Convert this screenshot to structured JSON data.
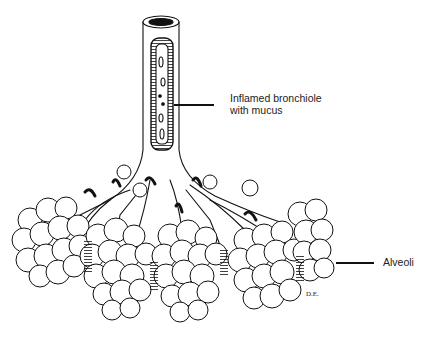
{
  "figure": {
    "labels": {
      "bronchiole_line1": "Inflamed bronchiole",
      "bronchiole_line2": "with mucus",
      "alveoli": "Alveoli",
      "signature": "D.E."
    },
    "colors": {
      "ink": "#111111",
      "background": "#ffffff"
    }
  }
}
